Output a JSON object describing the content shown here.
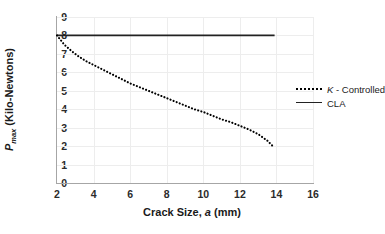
{
  "chart_data": {
    "type": "line",
    "title": "",
    "xlabel": "Crack Size, a (mm)",
    "ylabel": "Pmax (Kilo-Newtons)",
    "xlim": [
      2,
      16
    ],
    "ylim": [
      0,
      9
    ],
    "xticks": [
      2,
      4,
      6,
      8,
      10,
      12,
      14,
      16
    ],
    "yticks": [
      0,
      1,
      2,
      3,
      4,
      5,
      6,
      7,
      8,
      9
    ],
    "grid": true,
    "legend_position": "right-middle",
    "series": [
      {
        "name": "K - Controlled",
        "style": "dotted",
        "color": "#000000",
        "x": [
          2.0,
          2.4,
          2.8,
          3.2,
          3.6,
          4.0,
          4.5,
          5.0,
          5.5,
          6.0,
          6.5,
          7.0,
          7.5,
          8.0,
          8.5,
          9.0,
          9.5,
          10.0,
          10.5,
          11.0,
          11.5,
          12.0,
          12.5,
          13.0,
          13.5,
          13.85
        ],
        "y": [
          8.0,
          7.5,
          7.15,
          6.85,
          6.6,
          6.4,
          6.15,
          5.9,
          5.65,
          5.4,
          5.2,
          5.0,
          4.8,
          4.6,
          4.4,
          4.2,
          4.0,
          3.85,
          3.65,
          3.45,
          3.3,
          3.1,
          2.9,
          2.65,
          2.3,
          1.95
        ]
      },
      {
        "name": "CLA",
        "style": "solid",
        "color": "#222222",
        "x": [
          2.0,
          13.9
        ],
        "y": [
          8.0,
          8.0
        ]
      }
    ]
  },
  "axes": {
    "x_tick_labels": [
      "2",
      "4",
      "6",
      "8",
      "10",
      "12",
      "14",
      "16"
    ],
    "y_tick_labels": [
      "0",
      "1",
      "2",
      "3",
      "4",
      "5",
      "6",
      "7",
      "8",
      "9"
    ],
    "x_title_prefix": "Crack Size, ",
    "x_title_italic": "a",
    "x_title_suffix": " (mm)",
    "y_title_italic": "P",
    "y_title_sub": "max",
    "y_title_suffix": " (Kilo-Newtons)"
  },
  "legend": {
    "items": [
      {
        "italic": "K",
        "rest": " - Controlled",
        "swatch": "dotted-line-swatch"
      },
      {
        "italic": "",
        "rest": "CLA",
        "swatch": "solid-line-swatch"
      }
    ]
  },
  "colors": {
    "background": "#ffffff",
    "axis": "#a6a6a6",
    "grid": "#ededed",
    "series_dotted": "#000000",
    "series_solid": "#222222",
    "text": "#1a1a1a"
  }
}
